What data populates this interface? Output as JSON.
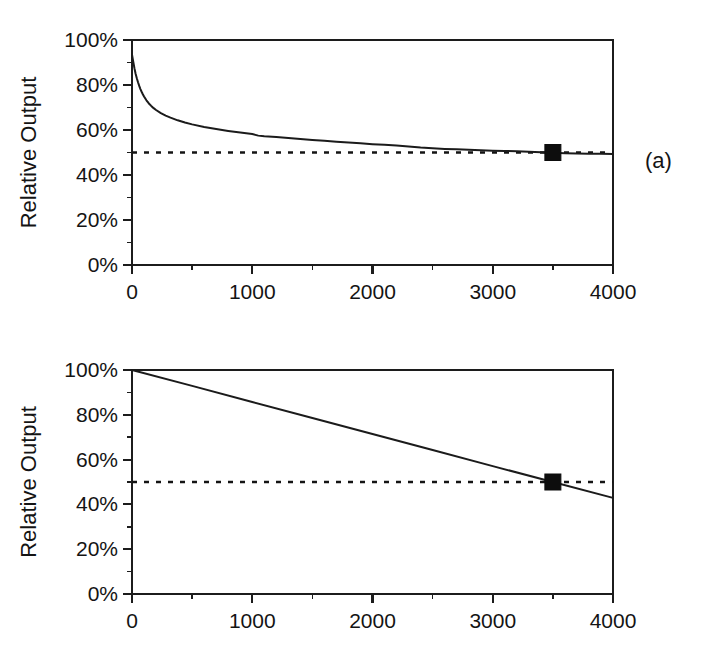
{
  "figure": {
    "background": "#ffffff",
    "ink_color": "#141414",
    "panel_tags": [
      {
        "id": "a",
        "label": "(a)"
      },
      {
        "id": "b",
        "label": "(b)"
      }
    ]
  },
  "chart_data": [
    {
      "type": "line",
      "panel": "a",
      "title": "",
      "xlabel": "",
      "ylabel": "Relative Output",
      "xlim": [
        0,
        4000
      ],
      "ylim": [
        0,
        100
      ],
      "grid": false,
      "legend": null,
      "x_ticks": [
        0,
        1000,
        2000,
        3000,
        4000
      ],
      "x_tick_labels": [
        "0",
        "1000",
        "2000",
        "3000",
        "4000"
      ],
      "x_minor_ticks": [
        500,
        1500,
        2500,
        3500
      ],
      "y_ticks": [
        0,
        20,
        40,
        60,
        80,
        100
      ],
      "y_tick_labels": [
        "0%",
        "20%",
        "40%",
        "60%",
        "80%",
        "100%"
      ],
      "y_minor_ticks": [
        10,
        30,
        50,
        70,
        90
      ],
      "series": [
        {
          "name": "relative output decay",
          "style": "solid",
          "x": [
            0,
            10,
            20,
            30,
            40,
            50,
            60,
            70,
            80,
            90,
            100,
            120,
            140,
            160,
            180,
            200,
            240,
            280,
            320,
            380,
            440,
            500,
            600,
            700,
            800,
            900,
            1000,
            1050,
            1100,
            1200,
            1300,
            1400,
            1500,
            1600,
            1700,
            1800,
            1900,
            2000,
            2100,
            2200,
            2300,
            2400,
            2500,
            2600,
            2700,
            2800,
            2900,
            3000,
            3100,
            3200,
            3300,
            3400,
            3500,
            3600,
            3700,
            3800,
            3900,
            4000
          ],
          "y": [
            93.5,
            90.5,
            87.5,
            85.0,
            83.0,
            81.2,
            79.6,
            78.2,
            77.0,
            75.9,
            74.9,
            73.2,
            71.8,
            70.7,
            69.7,
            68.9,
            67.5,
            66.4,
            65.5,
            64.3,
            63.3,
            62.5,
            61.3,
            60.4,
            59.6,
            58.9,
            58.2,
            57.5,
            57.2,
            56.9,
            56.4,
            56.0,
            55.6,
            55.2,
            54.8,
            54.4,
            54.1,
            53.7,
            53.4,
            53.1,
            52.7,
            52.2,
            51.9,
            51.6,
            51.4,
            51.2,
            51.0,
            50.8,
            50.7,
            50.6,
            50.3,
            50.1,
            49.9,
            49.7,
            49.6,
            49.5,
            49.4,
            49.3
          ]
        }
      ],
      "threshold": {
        "name": "50% reference",
        "value": 50,
        "style": "dotted"
      },
      "markers": [
        {
          "name": "lifetime point",
          "x": 3500,
          "y": 50,
          "shape": "square",
          "size": 16
        }
      ]
    },
    {
      "type": "line",
      "panel": "b",
      "title": "",
      "xlabel": "",
      "ylabel": "Relative Output",
      "xlim": [
        0,
        4000
      ],
      "ylim": [
        0,
        100
      ],
      "grid": false,
      "legend": null,
      "x_ticks": [
        0,
        1000,
        2000,
        3000,
        4000
      ],
      "x_tick_labels": [
        "0",
        "1000",
        "2000",
        "3000",
        "4000"
      ],
      "x_minor_ticks": [
        500,
        1500,
        2500,
        3500
      ],
      "y_ticks": [
        0,
        20,
        40,
        60,
        80,
        100
      ],
      "y_tick_labels": [
        "0%",
        "20%",
        "40%",
        "60%",
        "80%",
        "100%"
      ],
      "y_minor_ticks": [
        10,
        30,
        50,
        70,
        90
      ],
      "series": [
        {
          "name": "relative output linear decay",
          "style": "solid",
          "x": [
            0,
            500,
            1000,
            1500,
            2000,
            2500,
            3000,
            3500,
            4000
          ],
          "y": [
            100.0,
            92.9,
            85.7,
            78.6,
            71.4,
            64.3,
            57.1,
            50.0,
            42.9
          ]
        }
      ],
      "threshold": {
        "name": "50% reference",
        "value": 50,
        "style": "dotted"
      },
      "markers": [
        {
          "name": "lifetime point",
          "x": 3500,
          "y": 50,
          "shape": "square",
          "size": 16
        }
      ]
    }
  ]
}
